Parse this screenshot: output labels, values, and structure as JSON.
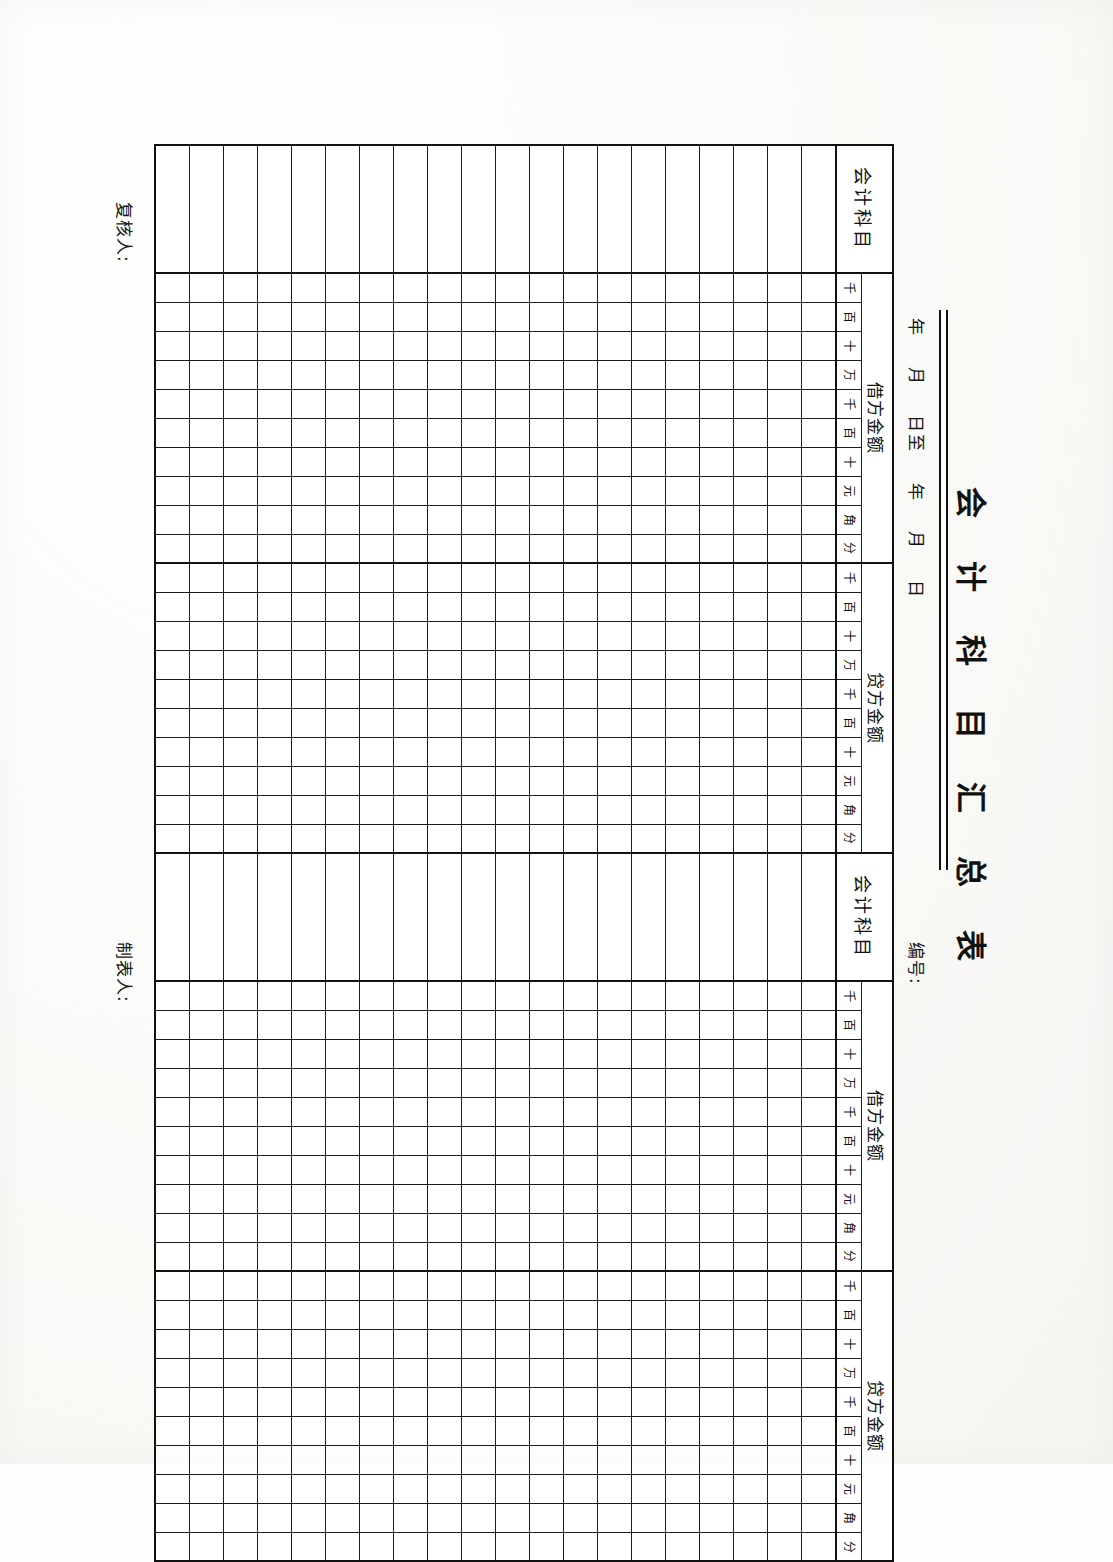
{
  "document": {
    "title": "会 计 科 目 汇 总 表",
    "period_label": "年    月    日至    年    月    日",
    "number_label": "编号:",
    "prepared_by_label": "制表人:",
    "reviewed_by_label": "复核人:"
  },
  "table": {
    "row_count": 20,
    "sections": [
      {
        "id": "left-subject",
        "kind": "subject",
        "header": "会计科目"
      },
      {
        "id": "left-debit",
        "kind": "amount",
        "header": "借方金额",
        "units": [
          "千",
          "百",
          "十",
          "万",
          "千",
          "百",
          "十",
          "元",
          "角",
          "分"
        ]
      },
      {
        "id": "left-credit",
        "kind": "amount",
        "header": "贷方金额",
        "units": [
          "千",
          "百",
          "十",
          "万",
          "千",
          "百",
          "十",
          "元",
          "角",
          "分"
        ]
      },
      {
        "id": "right-subject",
        "kind": "subject",
        "header": "会计科目"
      },
      {
        "id": "right-debit",
        "kind": "amount",
        "header": "借方金额",
        "units": [
          "千",
          "百",
          "十",
          "万",
          "千",
          "百",
          "十",
          "元",
          "角",
          "分"
        ]
      },
      {
        "id": "right-credit",
        "kind": "amount",
        "header": "贷方金额",
        "units": [
          "千",
          "百",
          "十",
          "万",
          "千",
          "百",
          "十",
          "元",
          "角",
          "分"
        ]
      }
    ],
    "cells": []
  },
  "colors": {
    "ink": "#111111",
    "rule": "#1c1c1c",
    "paper": "#fdfdfb"
  }
}
